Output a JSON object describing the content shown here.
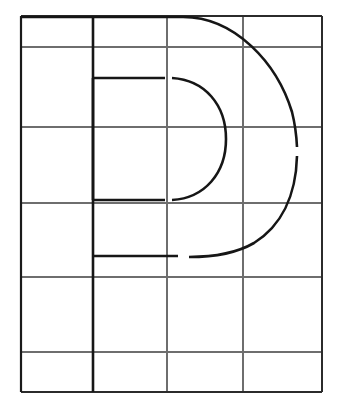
{
  "figure": {
    "name": "letter-p-grid-construction",
    "glyph": "P",
    "background_color": "#ffffff",
    "canvas": {
      "width": 341,
      "height": 415
    }
  },
  "grid": {
    "name": "construction-grid",
    "stroke_color": "#6e6e6e",
    "stroke_width": 1.1,
    "border_color": "#1a1a1a",
    "border_width": 2.2,
    "columns": 4,
    "rows": 6,
    "x_lines": [
      21,
      93,
      167,
      243,
      322
    ],
    "y_lines": [
      16,
      47,
      127,
      203,
      277,
      352,
      392
    ],
    "bounds": {
      "left": 21,
      "top": 16,
      "right": 322,
      "bottom": 392
    }
  },
  "glyph_strokes": {
    "stroke_color": "#161616",
    "stroke_width": 2.6,
    "stem": {
      "name": "p-stem",
      "x": 93,
      "y_top": 16,
      "y_bottom": 392
    },
    "top_arm": {
      "name": "p-top-arm",
      "x_start": 21,
      "x_end": 183,
      "y": 17
    },
    "outer_bowl_upper": {
      "name": "p-outer-bowl-upper-arc",
      "start": {
        "x": 183,
        "y": 17
      },
      "end": {
        "x": 297,
        "y": 147
      },
      "control": {
        "x": 267,
        "y": 28
      }
    },
    "outer_bowl_lower": {
      "name": "p-outer-bowl-lower-arc",
      "start": {
        "x": 297,
        "y": 156
      },
      "end": {
        "x": 189,
        "y": 257
      },
      "control": {
        "x": 281,
        "y": 240
      }
    },
    "bottom_arm_left": {
      "name": "p-bowl-bottom-arm-left",
      "x_start": 93,
      "x_end": 178,
      "y": 256
    },
    "bottom_arm_gap": {
      "name": "p-bowl-bottom-arm-gap",
      "x_start": 178,
      "x_end": 189
    },
    "counter_top_arm": {
      "name": "p-counter-top-arm",
      "x_start": 93,
      "x_end": 165,
      "y": 78
    },
    "counter_bottom_arm": {
      "name": "p-counter-bottom-arm",
      "x_start": 93,
      "x_end": 165,
      "y": 200
    },
    "counter_left_edge": {
      "name": "p-counter-left-edge",
      "x": 93,
      "y_top": 78,
      "y_bottom": 200
    },
    "counter_arc": {
      "name": "p-counter-right-arc",
      "start": {
        "x": 172,
        "y": 78
      },
      "end": {
        "x": 172,
        "y": 200
      },
      "apex": {
        "x": 226,
        "y": 139
      }
    },
    "outer_arc_gap": {
      "name": "p-outer-arc-gap",
      "x": 297,
      "y_start": 147,
      "y_end": 156
    }
  }
}
